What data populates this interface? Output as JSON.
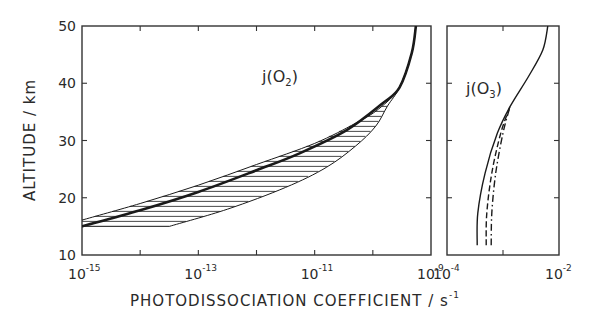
{
  "chart_data": {
    "type": "line",
    "ylabel": "ALTITUDE / km",
    "xlabel": "PHOTODISSOCIATION  COEFFICIENT / s",
    "xlabel_exp": "-1",
    "ylim": [
      10,
      50
    ],
    "yticks": [
      10,
      20,
      30,
      40,
      50
    ],
    "grid": false,
    "panels": [
      {
        "name": "j(O2)",
        "label_main": "j(O",
        "label_sub": "2",
        "label_end": ")",
        "xscale": "log",
        "xlim_exp": [
          -15,
          -9
        ],
        "xtick_labels": [
          {
            "base": "10",
            "exp": "-15",
            "value_exp": -15
          },
          {
            "base": "10",
            "exp": "-13",
            "value_exp": -13
          },
          {
            "base": "10",
            "exp": "-11",
            "value_exp": -11
          },
          {
            "base": "10",
            "exp": "-9",
            "value_exp": -9
          }
        ],
        "minor_ticks_exp": [
          -14,
          -12,
          -10
        ],
        "series": [
          {
            "name": "central",
            "style": "thick",
            "points_log10x_alt": [
              [
                -15.0,
                15.0
              ],
              [
                -14.0,
                17.8
              ],
              [
                -13.0,
                21.0
              ],
              [
                -12.0,
                24.8
              ],
              [
                -11.25,
                27.8
              ],
              [
                -10.45,
                31.8
              ],
              [
                -9.83,
                36.5
              ],
              [
                -9.54,
                39.3
              ],
              [
                -9.33,
                45.3
              ],
              [
                -9.26,
                50.0
              ]
            ]
          },
          {
            "name": "upper-bound",
            "style": "thin",
            "points_log10x_alt": [
              [
                -15.0,
                16.1
              ],
              [
                -14.0,
                19.0
              ],
              [
                -13.0,
                22.2
              ],
              [
                -12.0,
                25.8
              ],
              [
                -11.0,
                29.5
              ],
              [
                -10.3,
                33.0
              ],
              [
                -9.9,
                35.5
              ],
              [
                -9.54,
                39.3
              ],
              [
                -9.33,
                45.3
              ],
              [
                -9.26,
                50.0
              ]
            ]
          },
          {
            "name": "lower-bound",
            "style": "thin",
            "points_log10x_alt": [
              [
                -13.5,
                15.0
              ],
              [
                -12.5,
                18.0
              ],
              [
                -11.5,
                21.8
              ],
              [
                -10.8,
                25.3
              ],
              [
                -10.3,
                29.0
              ],
              [
                -9.95,
                32.5
              ],
              [
                -9.75,
                36.0
              ],
              [
                -9.54,
                39.3
              ],
              [
                -9.33,
                45.3
              ],
              [
                -9.26,
                50.0
              ]
            ]
          }
        ],
        "hatched_band": {
          "between": [
            "upper-bound",
            "lower-bound"
          ],
          "hatch": "horizontal"
        }
      },
      {
        "name": "j(O3)",
        "label_main": "j(O",
        "label_sub": "3",
        "label_end": ")",
        "xscale": "log",
        "xlim_exp": [
          -4,
          -2
        ],
        "xtick_labels": [
          {
            "base": "10",
            "exp": "-4",
            "value_exp": -4
          },
          {
            "base": "10",
            "exp": "-2",
            "value_exp": -2
          }
        ],
        "minor_ticks_exp": [
          -3
        ],
        "series": [
          {
            "name": "solid",
            "style": "solid",
            "points_log10x_alt": [
              [
                -3.46,
                11.7
              ],
              [
                -3.45,
                17.3
              ],
              [
                -3.32,
                24.3
              ],
              [
                -3.1,
                31.3
              ],
              [
                -2.875,
                35.9
              ],
              [
                -2.55,
                41.1
              ],
              [
                -2.29,
                45.8
              ],
              [
                -2.2,
                50.0
              ]
            ]
          },
          {
            "name": "dashed",
            "style": "dashed",
            "points_log10x_alt": [
              [
                -3.3,
                11.7
              ],
              [
                -3.29,
                17.3
              ],
              [
                -3.2,
                24.3
              ],
              [
                -3.04,
                31.3
              ],
              [
                -2.875,
                35.9
              ]
            ]
          },
          {
            "name": "dash-dot",
            "style": "dashdot",
            "points_log10x_alt": [
              [
                -3.21,
                11.7
              ],
              [
                -3.2,
                17.3
              ],
              [
                -3.13,
                24.3
              ],
              [
                -3.0,
                31.3
              ],
              [
                -2.875,
                35.9
              ]
            ]
          }
        ]
      }
    ]
  }
}
